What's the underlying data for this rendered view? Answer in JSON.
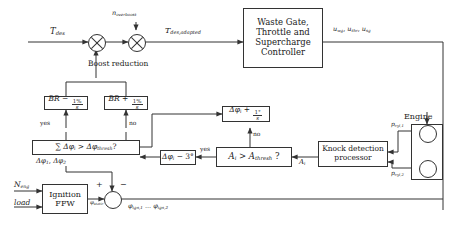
{
  "diagram": {
    "blocks": {
      "controller": {
        "line1": "Waste Gate,",
        "line2": "Throttle and",
        "line3": "Supercharge",
        "line4": "Controller"
      },
      "br_minus": {
        "base": "BR",
        "op": "−",
        "num": "1%",
        "den": "s"
      },
      "br_plus": {
        "base": "BR",
        "op": "+",
        "num": "1%",
        "den": "s"
      },
      "sum_test": {
        "text": "∑ Δφi > Δφthresh ?",
        "sigma": "∑",
        "delta": "Δφ",
        "isub": "i",
        "gt": ">",
        "rhs": "Δφ",
        "rsub": "thresh",
        "q": "?"
      },
      "phi_retard": {
        "lhs": "Δφ",
        "sub": "i",
        "op": "−",
        "value": "3°"
      },
      "amp_test": {
        "lhs": "A",
        "lsub": "i",
        "gt": ">",
        "rhs": "A",
        "rsub": "thresh",
        "q": "?"
      },
      "phi_advance": {
        "lhs": "Δφ",
        "sub": "i",
        "op": "+",
        "num": "1°",
        "den": "s"
      },
      "knock": {
        "line1": "Knock detection",
        "line2": "processor"
      },
      "ignition": {
        "line1": "Ignition",
        "line2": "FFW"
      }
    },
    "signals": {
      "t_des": {
        "base": "T",
        "sub": "des"
      },
      "n_overboost": {
        "base": "n",
        "sub": "overboost"
      },
      "t_des_adapted": {
        "base": "T",
        "sub": "des,adapted"
      },
      "actuators": {
        "text": "uwg, uthr, usg",
        "u1": "u",
        "s1": "wg",
        "u2": "u",
        "s2": "thr",
        "u3": "u",
        "s3": "sg"
      },
      "boost_reduction": "Boost reduction",
      "yes_left": "yes",
      "no_right": "no",
      "yes_mid": "yes",
      "no_mid": "no",
      "delta_phis": {
        "base1": "Δφ",
        "sub1": "1",
        "sep": ", ",
        "base2": "Δφ",
        "sub2": "2"
      },
      "a_i": {
        "base": "A",
        "sub": "i"
      },
      "n_eng": {
        "base": "N",
        "sub": "eng"
      },
      "load": "load",
      "phi_static": {
        "base": "φ",
        "sub": "static"
      },
      "plus": "+",
      "minus": "−",
      "phi_ign": {
        "base1": "φ",
        "sub1": "ign,1",
        "sep": " ... ",
        "base2": "φ",
        "sub2": "ign,2"
      },
      "engine": "Engine",
      "p_cyl_1": {
        "base": "p",
        "sub": "cyl,1"
      },
      "p_cyl_2": {
        "base": "p",
        "sub": "cyl,2"
      }
    },
    "colors": {
      "line": "#333333",
      "background": "#ffffff",
      "text": "#1a1a1a"
    }
  }
}
